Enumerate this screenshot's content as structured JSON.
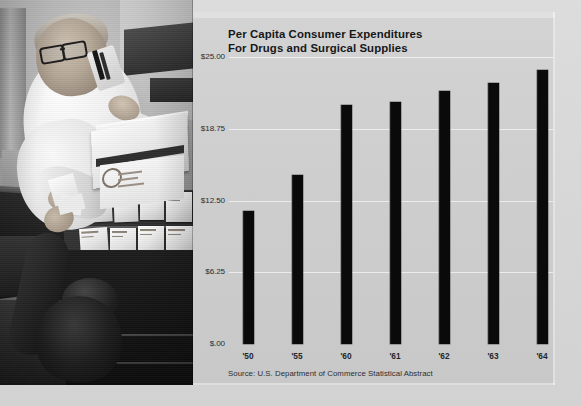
{
  "chart_data": {
    "type": "bar",
    "title": "Per Capita Consumer Expenditures For Drugs and Surgical Supplies",
    "title_line1": "Per Capita Consumer Expenditures",
    "title_line2": "For Drugs and Surgical Supplies",
    "categories": [
      "'50",
      "'55",
      "'60",
      "'61",
      "'62",
      "'63",
      "'64"
    ],
    "values": [
      11.6,
      14.7,
      20.8,
      21.1,
      22.0,
      22.7,
      23.9
    ],
    "xlabel": "",
    "ylabel": "",
    "ylim": [
      0,
      25
    ],
    "ytick_values": [
      25.0,
      18.75,
      12.5,
      6.25,
      0
    ],
    "ytick_labels": [
      "$25.00",
      "$18.75",
      "$12.50",
      "$6.25",
      "$.00"
    ],
    "grid": true,
    "legend": null,
    "source": "Source: U.S. Department of Commerce Statistical Abstract",
    "bar_color": "#0a0a0a",
    "panel_color": "#d0d0d0"
  },
  "photo": {
    "caption": "pharmacist-filling-prescription-photograph",
    "subjects": [
      "pharmacist-in-white-coat",
      "customer-at-counter",
      "shelved-medicine-boxes"
    ]
  }
}
